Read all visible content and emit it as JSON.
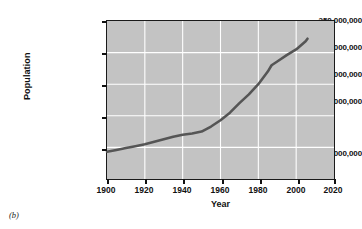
{
  "figure": {
    "caption": "(b)"
  },
  "chart_data": {
    "type": "line",
    "title": "",
    "xlabel": "Year",
    "ylabel": "Population",
    "xlim": [
      1900,
      2020
    ],
    "ylim": [
      0,
      250000000
    ],
    "grid": true,
    "legend": null,
    "xticks": [
      1900,
      1920,
      1940,
      1960,
      1980,
      2000,
      2020
    ],
    "xtick_labels": [
      "1900",
      "1920",
      "1940",
      "1960",
      "1980",
      "2000",
      "2020"
    ],
    "yticks": [
      50000000,
      100000000,
      150000000,
      200000000,
      250000000
    ],
    "ytick_labels": [
      "50,000,000",
      "100,000,000",
      "150,000,000",
      "200,000,000",
      "250,000,000"
    ],
    "line_color": "#555555",
    "plot_background": "#c3c3c3",
    "gridline_color": "#ffffff",
    "series": [
      {
        "name": "Population",
        "x": [
          1900,
          1905,
          1910,
          1915,
          1920,
          1925,
          1930,
          1935,
          1940,
          1945,
          1950,
          1955,
          1960,
          1965,
          1970,
          1975,
          1980,
          1985,
          1987,
          1990,
          1995,
          2000,
          2005,
          2006
        ],
        "values": [
          43000000,
          46000000,
          49000000,
          52000000,
          55000000,
          59000000,
          63000000,
          67000000,
          70000000,
          72000000,
          75000000,
          83000000,
          93000000,
          105000000,
          120000000,
          134000000,
          150000000,
          170000000,
          180000000,
          186000000,
          196000000,
          205000000,
          218000000,
          222000000
        ]
      }
    ]
  }
}
